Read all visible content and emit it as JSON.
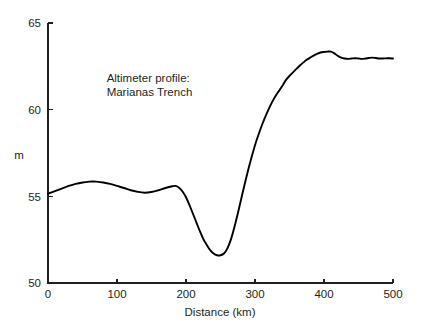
{
  "chart_data": {
    "type": "line",
    "title": "",
    "xlabel": "Distance (km)",
    "ylabel": "m",
    "xlim": [
      0,
      500
    ],
    "ylim": [
      50,
      65
    ],
    "grid": false,
    "legend": "none",
    "xticks": [
      0,
      100,
      200,
      300,
      400,
      500
    ],
    "xtick_labels": [
      "0",
      "100",
      "200",
      "300",
      "400",
      "500"
    ],
    "yticks": [
      50,
      55,
      60,
      65
    ],
    "ytick_labels": [
      "50",
      "55",
      "60",
      "65"
    ],
    "annotations": [
      {
        "name": "profile-annotation",
        "lines": [
          "Altimeter profile:",
          "Marianas Trench"
        ],
        "x": 85,
        "y": 61.6
      }
    ],
    "series": [
      {
        "name": "altimeter-profile",
        "color": "#000000",
        "x": [
          0,
          10,
          20,
          30,
          40,
          50,
          60,
          65,
          70,
          80,
          90,
          100,
          110,
          120,
          130,
          140,
          150,
          160,
          170,
          180,
          185,
          190,
          195,
          200,
          205,
          210,
          215,
          220,
          225,
          230,
          235,
          240,
          245,
          250,
          255,
          260,
          265,
          270,
          275,
          280,
          285,
          290,
          295,
          300,
          305,
          310,
          315,
          320,
          325,
          330,
          335,
          340,
          345,
          350,
          355,
          360,
          365,
          370,
          375,
          380,
          385,
          390,
          395,
          400,
          405,
          410,
          415,
          420,
          425,
          430,
          435,
          440,
          445,
          450,
          455,
          460,
          465,
          470,
          475,
          480,
          485,
          490,
          495,
          500
        ],
        "y": [
          55.15,
          55.3,
          55.45,
          55.6,
          55.72,
          55.8,
          55.85,
          55.86,
          55.85,
          55.8,
          55.72,
          55.6,
          55.48,
          55.35,
          55.26,
          55.21,
          55.25,
          55.35,
          55.48,
          55.58,
          55.6,
          55.5,
          55.28,
          54.95,
          54.5,
          54.0,
          53.5,
          53.0,
          52.55,
          52.2,
          51.9,
          51.7,
          51.6,
          51.6,
          51.7,
          52.0,
          52.5,
          53.2,
          54.0,
          54.85,
          55.7,
          56.5,
          57.25,
          57.95,
          58.55,
          59.1,
          59.6,
          60.05,
          60.45,
          60.8,
          61.1,
          61.4,
          61.72,
          61.95,
          62.15,
          62.35,
          62.55,
          62.72,
          62.88,
          63.0,
          63.12,
          63.22,
          63.3,
          63.33,
          63.35,
          63.35,
          63.25,
          63.1,
          63.0,
          62.95,
          62.93,
          62.95,
          62.97,
          62.95,
          62.93,
          62.95,
          62.98,
          63.0,
          62.98,
          62.95,
          62.95,
          62.96,
          62.97,
          62.95
        ]
      }
    ]
  }
}
